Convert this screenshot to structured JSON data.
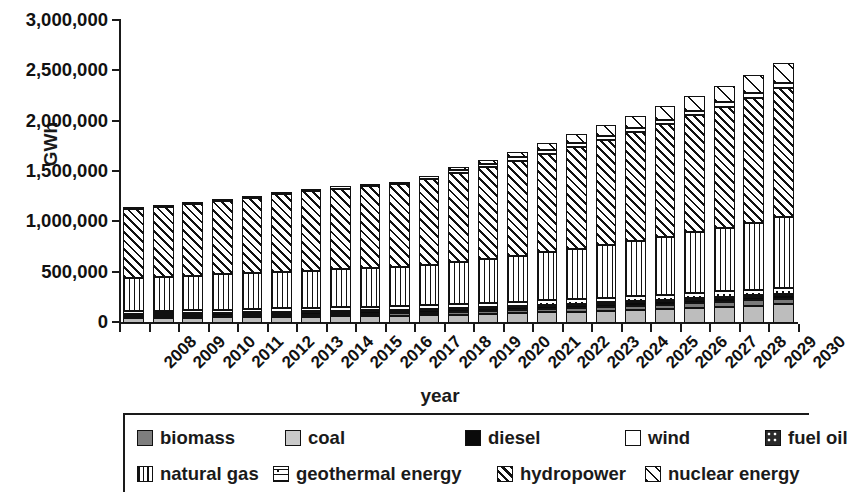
{
  "chart_data": {
    "type": "bar",
    "subtype": "stacked-bar",
    "title": "",
    "xlabel": "year",
    "ylabel": "GWh",
    "ylim": [
      0,
      3000000
    ],
    "ytick_values": [
      0,
      500000,
      1000000,
      1500000,
      2000000,
      2500000,
      3000000
    ],
    "ytick_labels": [
      "0",
      "500,000",
      "1,000,000",
      "1,500,000",
      "2,000,000",
      "2,500,000",
      "3,000,000"
    ],
    "grid": false,
    "legend_position": "bottom",
    "categories": [
      "2008",
      "2009",
      "2010",
      "2011",
      "2012",
      "2013",
      "2014",
      "2015",
      "2016",
      "2017",
      "2018",
      "2019",
      "2020",
      "2021",
      "2022",
      "2023",
      "2024",
      "2025",
      "2026",
      "2027",
      "2028",
      "2029",
      "2030"
    ],
    "stack_order_bottom_to_top": [
      "coal",
      "biomass",
      "diesel",
      "fuel oil",
      "geothermal energy",
      "natural gas",
      "hydropower",
      "wind",
      "nuclear energy"
    ],
    "series": [
      {
        "name": "coal",
        "pattern": "solid-light-gray",
        "color": "#bdbdbd",
        "values": [
          48000,
          50000,
          52000,
          55000,
          58000,
          61000,
          64000,
          67000,
          70000,
          73000,
          78000,
          84000,
          90000,
          97000,
          105000,
          113000,
          122000,
          130000,
          140000,
          150000,
          160000,
          172000,
          184000
        ]
      },
      {
        "name": "biomass",
        "pattern": "solid-dark-gray",
        "color": "#7a7a7a",
        "values": [
          14000,
          15000,
          16000,
          17000,
          18000,
          19000,
          20000,
          21000,
          22000,
          23000,
          25000,
          27000,
          29000,
          31000,
          33000,
          35000,
          38000,
          40000,
          43000,
          46000,
          49000,
          52000,
          56000
        ]
      },
      {
        "name": "diesel",
        "pattern": "solid-black",
        "color": "#0a0a0a",
        "values": [
          22000,
          22000,
          23000,
          23000,
          24000,
          24000,
          25000,
          25000,
          26000,
          26000,
          27000,
          28000,
          29000,
          30000,
          31000,
          32000,
          33000,
          34000,
          35000,
          36000,
          37000,
          38000,
          40000
        ]
      },
      {
        "name": "fuel oil",
        "pattern": "dark-with-white-dots",
        "color": "#2a2a2a",
        "values": [
          8000,
          8000,
          8000,
          8000,
          9000,
          9000,
          9000,
          9000,
          9000,
          9000,
          9000,
          10000,
          10000,
          10000,
          10000,
          11000,
          11000,
          11000,
          11000,
          12000,
          12000,
          12000,
          12000
        ]
      },
      {
        "name": "geothermal energy",
        "pattern": "dotted-dashed",
        "color": "#ffffff",
        "values": [
          28000,
          29000,
          30000,
          31000,
          32000,
          33000,
          34000,
          35000,
          36000,
          37000,
          38000,
          40000,
          41000,
          43000,
          45000,
          46000,
          48000,
          50000,
          52000,
          54000,
          56000,
          58000,
          60000
        ]
      },
      {
        "name": "natural gas",
        "pattern": "vertical-lines",
        "color": "#ffffff",
        "values": [
          324000,
          332000,
          340000,
          348000,
          355000,
          362000,
          369000,
          375000,
          381000,
          387000,
          400000,
          418000,
          437000,
          457000,
          479000,
          502000,
          526000,
          551000,
          577000,
          605000,
          634000,
          665000,
          697000
        ]
      },
      {
        "name": "hydropower",
        "pattern": "diagonal-hatch",
        "color": "#ffffff",
        "values": [
          690000,
          693000,
          710000,
          730000,
          750000,
          770000,
          787000,
          802000,
          815000,
          823000,
          858000,
          885000,
          915000,
          945000,
          977000,
          1010000,
          1045000,
          1082000,
          1120000,
          1160000,
          1200000,
          1243000,
          1287000
        ]
      },
      {
        "name": "wind",
        "pattern": "white",
        "color": "#ffffff",
        "values": [
          16000,
          17000,
          18000,
          19000,
          20000,
          21000,
          22000,
          23000,
          24000,
          25000,
          26000,
          28000,
          30000,
          32000,
          34000,
          36000,
          38000,
          40000,
          42000,
          44000,
          46000,
          48000,
          50000
        ]
      },
      {
        "name": "nuclear energy",
        "pattern": "sparse-diagonal",
        "color": "#ffffff",
        "values": [
          0,
          0,
          0,
          0,
          0,
          0,
          0,
          0,
          0,
          0,
          0,
          30000,
          40000,
          55000,
          70000,
          90000,
          105000,
          120000,
          135000,
          150000,
          165000,
          180000,
          195000
        ]
      }
    ],
    "totals": [
      1150000,
      1166000,
      1197000,
      1231000,
      1266000,
      1299000,
      1330000,
      1357000,
      1383000,
      1403000,
      1461000,
      1550000,
      1621000,
      1700000,
      1784000,
      1875000,
      1966000,
      2058000,
      2155000,
      2257000,
      2359000,
      2468000,
      2581000
    ]
  },
  "legend": {
    "row1": [
      {
        "label": "biomass",
        "swatch": "sw-biomass",
        "icon": "biomass-swatch-icon"
      },
      {
        "label": "coal",
        "swatch": "sw-coal",
        "icon": "coal-swatch-icon"
      },
      {
        "label": "diesel",
        "swatch": "sw-diesel",
        "icon": "diesel-swatch-icon"
      },
      {
        "label": "wind",
        "swatch": "sw-wind",
        "icon": "wind-swatch-icon"
      },
      {
        "label": "fuel oil",
        "swatch": "sw-fueloil",
        "icon": "fuel-oil-swatch-icon"
      }
    ],
    "row2": [
      {
        "label": "natural gas",
        "swatch": "sw-gas",
        "icon": "natural-gas-swatch-icon"
      },
      {
        "label": "geothermal energy",
        "swatch": "sw-geo",
        "icon": "geothermal-energy-swatch-icon"
      },
      {
        "label": "hydropower",
        "swatch": "sw-hydro",
        "icon": "hydropower-swatch-icon"
      },
      {
        "label": "nuclear energy",
        "swatch": "sw-nuclear",
        "icon": "nuclear-energy-swatch-icon"
      }
    ]
  }
}
